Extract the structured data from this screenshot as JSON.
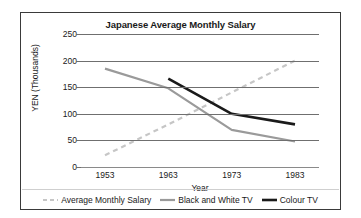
{
  "chart_data": {
    "type": "line",
    "title": "Japanese Average Monthly Salary",
    "xlabel": "Year",
    "ylabel": "YEN (Thousands)",
    "x": [
      1953,
      1963,
      1973,
      1983
    ],
    "xticklabels": [
      "1953",
      "1963",
      "1973",
      "1983"
    ],
    "yticks": [
      0,
      50,
      100,
      150,
      200,
      250
    ],
    "yticklabels": [
      "0",
      "50",
      "100",
      "150",
      "200",
      "250"
    ],
    "ylim": [
      0,
      250
    ],
    "grid": true,
    "legend_position": "bottom",
    "series": [
      {
        "name": "Average Monthly Salary",
        "values": [
          22,
          80,
          140,
          200
        ],
        "color": "#c6c6c6",
        "style": "dashed",
        "width": 2.2
      },
      {
        "name": "Black and White TV",
        "values": [
          185,
          148,
          70,
          48
        ],
        "color": "#9a9a9a",
        "style": "solid",
        "width": 2.2
      },
      {
        "name": "Colour TV",
        "values": [
          null,
          166,
          100,
          80
        ],
        "color": "#1a1a1a",
        "style": "solid",
        "width": 2.6
      }
    ]
  }
}
